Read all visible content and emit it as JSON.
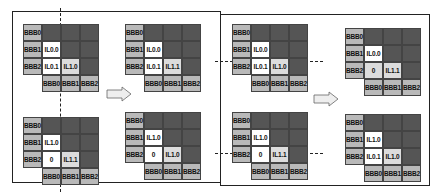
{
  "colors": {
    "label_cell": "#b9b9b9",
    "dark_cell": "#555555",
    "white_cell": "#ffffff",
    "light_cell": "#dcdcdc",
    "border": "#222222"
  },
  "grids": [
    {
      "id": "left-top",
      "rows": [
        "BBB0",
        "BBB1",
        "BBB2"
      ],
      "cols": [
        "BBB0",
        "BBB1",
        "BBB2"
      ],
      "cells": [
        [
          "",
          "",
          ""
        ],
        [
          "IL0.0",
          "",
          ""
        ],
        [
          "IL0.1",
          "IL1.0",
          ""
        ]
      ]
    },
    {
      "id": "left-bottom",
      "rows": [
        "BBB0",
        "BBB1",
        "BBB2"
      ],
      "cols": [
        "BBB0",
        "BBB1",
        "BBB2"
      ],
      "cells": [
        [
          "",
          "",
          ""
        ],
        [
          "IL1.0",
          "",
          ""
        ],
        [
          "0",
          "IL1.1",
          ""
        ]
      ]
    },
    {
      "id": "mid-left-top",
      "rows": [
        "BBB0",
        "BBB1",
        "BBB2"
      ],
      "cols": [
        "BBB0",
        "BBB1",
        "BBB2"
      ],
      "cells": [
        [
          "",
          "",
          ""
        ],
        [
          "IL0.0",
          "",
          ""
        ],
        [
          "IL0.1",
          "IL1.1",
          ""
        ]
      ]
    },
    {
      "id": "mid-left-bottom",
      "rows": [
        "BBB0",
        "BBB1",
        "BBB2"
      ],
      "cols": [
        "BBB0",
        "BBB1",
        "BBB2"
      ],
      "cells": [
        [
          "",
          "",
          ""
        ],
        [
          "IL1.0",
          "",
          ""
        ],
        [
          "0",
          "IL1.0",
          ""
        ]
      ]
    },
    {
      "id": "mid-right-top",
      "rows": [
        "BBB0",
        "BBB1",
        "BBB2"
      ],
      "cols": [
        "BBB0",
        "BBB1",
        "BBB2"
      ],
      "cells": [
        [
          "",
          "",
          ""
        ],
        [
          "IL0.0",
          "",
          ""
        ],
        [
          "IL0.1",
          "IL1.0",
          ""
        ]
      ]
    },
    {
      "id": "mid-right-bottom",
      "rows": [
        "BBB0",
        "BBB1",
        "BBB2"
      ],
      "cols": [
        "BBB0",
        "BBB1",
        "BBB2"
      ],
      "cells": [
        [
          "",
          "",
          ""
        ],
        [
          "IL1.0",
          "",
          ""
        ],
        [
          "0",
          "IL1.1",
          ""
        ]
      ]
    },
    {
      "id": "right-top",
      "rows": [
        "BBB0",
        "BBB1",
        "BBB2"
      ],
      "cols": [
        "BBB0",
        "BBB1",
        "BBB2"
      ],
      "cells": [
        [
          "",
          "",
          ""
        ],
        [
          "IL0.0",
          "",
          ""
        ],
        [
          "0",
          "IL1.1",
          ""
        ]
      ]
    },
    {
      "id": "right-bottom",
      "rows": [
        "BBB0",
        "BBB1",
        "BBB2"
      ],
      "cols": [
        "BBB0",
        "BBB1",
        "BBB2"
      ],
      "cells": [
        [
          "",
          "",
          ""
        ],
        [
          "IL1.0",
          "",
          ""
        ],
        [
          "IL0.1",
          "IL1.0",
          ""
        ]
      ]
    }
  ],
  "arrows": [
    "right-arrow-1",
    "right-arrow-2"
  ]
}
